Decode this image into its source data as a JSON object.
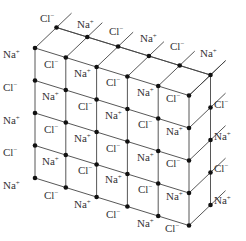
{
  "diagram": {
    "colors": {
      "line": "#444444",
      "node": "#111111",
      "text": "#333333",
      "background": "#ffffff"
    },
    "geometry": {
      "origin": [
        35,
        48
      ],
      "col_step": [
        30.8,
        9.5
      ],
      "row_step": [
        0,
        32.5
      ],
      "depth_step": [
        21.5,
        -20.5
      ],
      "cols": 6,
      "rows": 5,
      "depth_layers": 2
    },
    "ions": {
      "cation": {
        "symbol": "Na",
        "charge": "+"
      },
      "anion": {
        "symbol": "Cl",
        "charge": "−"
      }
    },
    "labels": [
      {
        "ion": "Cl",
        "x": 40,
        "y": 22
      },
      {
        "ion": "Na",
        "x": 77,
        "y": 28
      },
      {
        "ion": "Cl",
        "x": 109,
        "y": 35
      },
      {
        "ion": "Na",
        "x": 140,
        "y": 42
      },
      {
        "ion": "Cl",
        "x": 170,
        "y": 50
      },
      {
        "ion": "Na",
        "x": 200,
        "y": 57
      },
      {
        "ion": "Na",
        "x": 3,
        "y": 58
      },
      {
        "ion": "Cl",
        "x": 44,
        "y": 68
      },
      {
        "ion": "Na",
        "x": 74,
        "y": 77
      },
      {
        "ion": "Cl",
        "x": 106,
        "y": 86
      },
      {
        "ion": "Na",
        "x": 137,
        "y": 96
      },
      {
        "ion": "Cl",
        "x": 166,
        "y": 102
      },
      {
        "ion": "Cl",
        "x": 3,
        "y": 91
      },
      {
        "ion": "Na",
        "x": 42,
        "y": 100
      },
      {
        "ion": "Cl",
        "x": 78,
        "y": 110
      },
      {
        "ion": "Na",
        "x": 105,
        "y": 119
      },
      {
        "ion": "Cl",
        "x": 138,
        "y": 128
      },
      {
        "ion": "Na",
        "x": 166,
        "y": 135
      },
      {
        "ion": "Na",
        "x": 3,
        "y": 124
      },
      {
        "ion": "Cl",
        "x": 44,
        "y": 133
      },
      {
        "ion": "Na",
        "x": 74,
        "y": 142
      },
      {
        "ion": "Cl",
        "x": 106,
        "y": 152
      },
      {
        "ion": "Na",
        "x": 137,
        "y": 161
      },
      {
        "ion": "Cl",
        "x": 166,
        "y": 167
      },
      {
        "ion": "Cl",
        "x": 3,
        "y": 156
      },
      {
        "ion": "Na",
        "x": 42,
        "y": 165
      },
      {
        "ion": "Cl",
        "x": 78,
        "y": 174
      },
      {
        "ion": "Na",
        "x": 105,
        "y": 183
      },
      {
        "ion": "Cl",
        "x": 138,
        "y": 193
      },
      {
        "ion": "Na",
        "x": 166,
        "y": 200
      },
      {
        "ion": "Na",
        "x": 3,
        "y": 189
      },
      {
        "ion": "Cl",
        "x": 44,
        "y": 199
      },
      {
        "ion": "Na",
        "x": 74,
        "y": 208
      },
      {
        "ion": "Cl",
        "x": 106,
        "y": 218
      },
      {
        "ion": "Na",
        "x": 137,
        "y": 227
      },
      {
        "ion": "Cl",
        "x": 165,
        "y": 232
      },
      {
        "ion": "Cl",
        "x": 214,
        "y": 108
      },
      {
        "ion": "Na",
        "x": 214,
        "y": 140
      },
      {
        "ion": "Cl",
        "x": 214,
        "y": 172
      },
      {
        "ion": "Na",
        "x": 214,
        "y": 204
      }
    ]
  }
}
